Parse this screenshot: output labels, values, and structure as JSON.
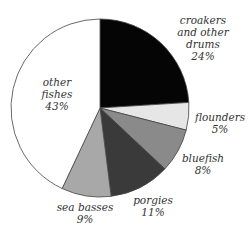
{
  "chart_data": {
    "type": "pie",
    "title": "",
    "start_angle_deg": 0,
    "direction": "clockwise",
    "slices": [
      {
        "label": "croakers and other drums",
        "value": 24,
        "display": "24%",
        "color": "#050505"
      },
      {
        "label": "flounders",
        "value": 5,
        "display": "5%",
        "color": "#e6e6e6"
      },
      {
        "label": "bluefish",
        "value": 8,
        "display": "8%",
        "color": "#8a8a8a"
      },
      {
        "label": "porgies",
        "value": 11,
        "display": "11%",
        "color": "#3a3a3a"
      },
      {
        "label": "sea basses",
        "value": 9,
        "display": "9%",
        "color": "#a8a8a8"
      },
      {
        "label": "other fishes",
        "value": 43,
        "display": "43%",
        "color": "#ffffff"
      }
    ]
  },
  "labels": {
    "croakers": {
      "line1": "croakers",
      "line2": "and other",
      "line3": "drums",
      "pct": "24%"
    },
    "flounders": {
      "line1": "flounders",
      "pct": "5%"
    },
    "bluefish": {
      "line1": "bluefish",
      "pct": "8%"
    },
    "porgies": {
      "line1": "porgies",
      "pct": "11%"
    },
    "sea_basses": {
      "line1": "sea basses",
      "pct": "9%"
    },
    "other": {
      "line1": "other",
      "line2": "fishes",
      "pct": "43%"
    }
  }
}
